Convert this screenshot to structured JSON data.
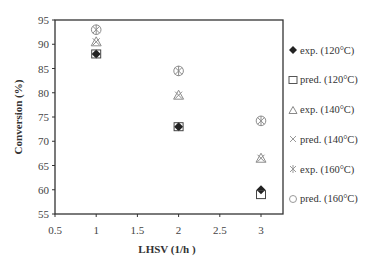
{
  "chart_data": {
    "type": "scatter",
    "title": "",
    "xlabel": "LHSV (1/h )",
    "ylabel": "Conversion (%)",
    "xlim": [
      0.5,
      3.25
    ],
    "ylim": [
      55,
      95
    ],
    "xticks": [
      0.5,
      1,
      1.5,
      2,
      2.5,
      3
    ],
    "xtick_labels": [
      "0.5",
      "1",
      "1.5",
      "2",
      "2.5",
      "3"
    ],
    "yticks": [
      55,
      60,
      65,
      70,
      75,
      80,
      85,
      90,
      95
    ],
    "ytick_labels": [
      "55",
      "60",
      "65",
      "70",
      "75",
      "80",
      "85",
      "90",
      "95"
    ],
    "grid": false,
    "legend_position": "right",
    "x": [
      1,
      2,
      3
    ],
    "series": [
      {
        "name": "exp. (120°C)",
        "marker": "diamond-filled",
        "values": [
          88.0,
          73.0,
          60.0
        ]
      },
      {
        "name": "pred. (120°C)",
        "marker": "square-open",
        "values": [
          88.0,
          73.0,
          59.0
        ]
      },
      {
        "name": "exp. (140°C)",
        "marker": "triangle-open",
        "values": [
          90.5,
          79.5,
          66.5
        ]
      },
      {
        "name": "pred. (140°C)",
        "marker": "x",
        "values": [
          90.5,
          79.5,
          66.5
        ]
      },
      {
        "name": "exp. (160°C)",
        "marker": "asterisk",
        "values": [
          93.0,
          84.5,
          74.2
        ]
      },
      {
        "name": "pred. (160°C)",
        "marker": "circle-open",
        "values": [
          93.0,
          84.5,
          74.2
        ]
      }
    ]
  },
  "legend": {
    "items": [
      {
        "label": "exp. (120°C)"
      },
      {
        "label": "pred. (120°C)"
      },
      {
        "label": "exp. (140°C)"
      },
      {
        "label": "pred. (140°C)"
      },
      {
        "label": "exp. (160°C)"
      },
      {
        "label": "pred. (160°C)"
      }
    ]
  },
  "colors": {
    "axis": "#333333",
    "marker_dark": "#222222",
    "marker_gray": "#8c8c8c"
  }
}
